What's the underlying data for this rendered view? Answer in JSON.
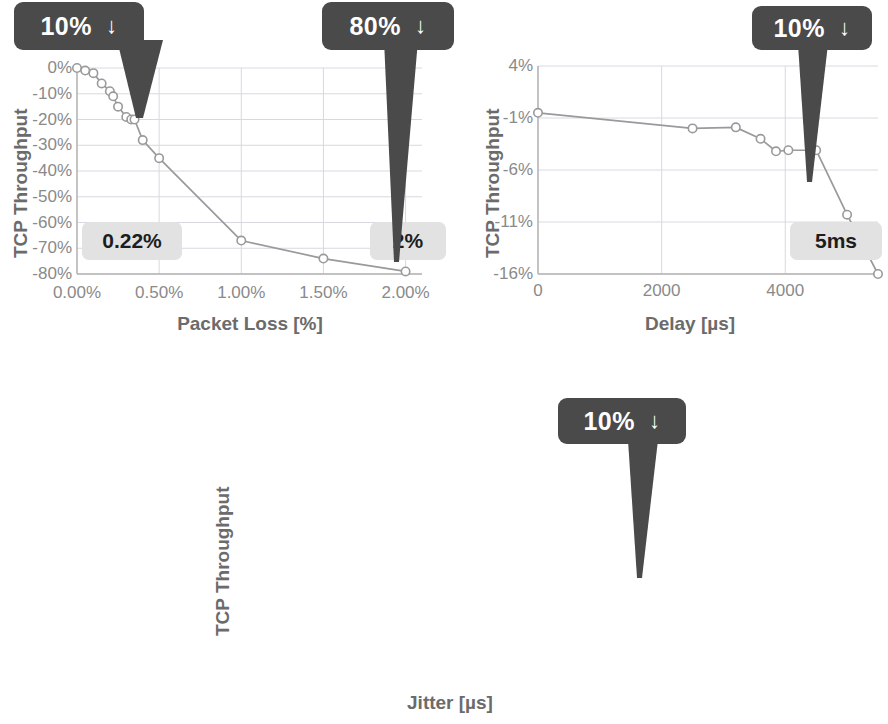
{
  "figure": {
    "background": "#ffffff",
    "line_color": "#9a9a9a",
    "marker_fill": "#ffffff",
    "marker_stroke": "#9a9a9a",
    "grid_color": "#d8d8e2",
    "axis_color": "#b5b5b5",
    "callout_bg": "#4a4a4a",
    "callout_text": "#ffffff",
    "badge_bg": "#e2e2e2",
    "badge_text": "#1d1d1d",
    "tick_text": "#8a8a8a",
    "title_text": "#6b6b6b",
    "arrow_glyph": "↓"
  },
  "chart_data": [
    {
      "id": "packet-loss",
      "type": "line",
      "title": "",
      "xlabel": "Packet Loss [%]",
      "ylabel": "TCP Throughput",
      "xticks": [
        "0.00%",
        "0.50%",
        "1.00%",
        "1.50%",
        "2.00%"
      ],
      "xtick_values": [
        0,
        0.5,
        1.0,
        1.5,
        2.0
      ],
      "yticks": [
        "0%",
        "-10%",
        "-20%",
        "-30%",
        "-40%",
        "-50%",
        "-60%",
        "-70%",
        "-80%"
      ],
      "ytick_values": [
        0,
        -10,
        -20,
        -30,
        -40,
        -50,
        -60,
        -70,
        -80
      ],
      "xlim": [
        0,
        2.1
      ],
      "ylim": [
        -80,
        0
      ],
      "grid": true,
      "legend": "none",
      "x": [
        0.0,
        0.05,
        0.1,
        0.15,
        0.2,
        0.22,
        0.25,
        0.3,
        0.33,
        0.35,
        0.4,
        0.5,
        1.0,
        1.5,
        2.0
      ],
      "y": [
        0,
        -1,
        -2,
        -6,
        -9,
        -11,
        -15,
        -19,
        -20,
        -20,
        -28,
        -35,
        -67,
        -74,
        -79
      ],
      "annotations": [
        {
          "label": "10%",
          "arrow": "↓",
          "points_to_x": 0.22,
          "badge": "0.22%"
        },
        {
          "label": "80%",
          "arrow": "↓",
          "points_to_x": 2.0,
          "badge": "2%"
        }
      ]
    },
    {
      "id": "delay",
      "type": "line",
      "title": "",
      "xlabel": "Delay [µs]",
      "ylabel": "TCP Throughput",
      "xticks": [
        "0",
        "2000",
        "4000"
      ],
      "xtick_values": [
        0,
        2000,
        4000
      ],
      "yticks": [
        "4%",
        "-1%",
        "-6%",
        "-11%",
        "-16%"
      ],
      "ytick_values": [
        4,
        -1,
        -6,
        -11,
        -16
      ],
      "xlim": [
        0,
        5500
      ],
      "ylim": [
        -16,
        4
      ],
      "grid": true,
      "legend": "none",
      "x": [
        0,
        2500,
        3200,
        3600,
        3850,
        4050,
        4500,
        5000,
        5500
      ],
      "y": [
        -0.5,
        -2.0,
        -1.9,
        -3.0,
        -4.2,
        -4.1,
        -4.1,
        -10.3,
        -16.0
      ],
      "annotations": [
        {
          "label": "10%",
          "arrow": "↓",
          "points_to_x": 5000,
          "badge": "5ms"
        }
      ]
    },
    {
      "id": "jitter",
      "type": "line",
      "title": "",
      "xlabel": "Jitter [µs]",
      "ylabel": "TCP Throughput",
      "xticks": [
        "0",
        "200",
        "400",
        "600",
        "800",
        "1000"
      ],
      "xtick_values": [
        0,
        200,
        400,
        600,
        800,
        1000
      ],
      "yticks": [
        "1%",
        "-1%",
        "-3%",
        "-5%",
        "-7%",
        "-9%",
        "-11%"
      ],
      "ytick_values": [
        1,
        -1,
        -3,
        -5,
        -7,
        -9,
        -11
      ],
      "xlim": [
        0,
        1030
      ],
      "ylim": [
        -11,
        1
      ],
      "grid": true,
      "legend": "none",
      "x": [
        0,
        25,
        100,
        200,
        300,
        400,
        500,
        600,
        700,
        800,
        1000
      ],
      "y": [
        0,
        -2.1,
        -3.05,
        -3.05,
        -4.1,
        -4.1,
        -5.05,
        -5.05,
        -7.1,
        -8.2,
        -10.9
      ],
      "annotations": [
        {
          "label": "10%",
          "arrow": "↓",
          "points_to_x": 1000,
          "badge": "1ms"
        }
      ]
    }
  ]
}
